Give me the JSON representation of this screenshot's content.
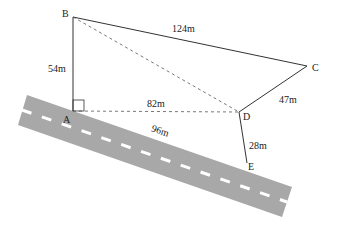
{
  "diagram": {
    "type": "geometry-figure",
    "road": {
      "fill": "#a8a8a8",
      "dash_color": "#ffffff",
      "length_label": "96m"
    },
    "points": {
      "A": {
        "label": "A",
        "x": 73,
        "y": 111
      },
      "B": {
        "label": "B",
        "x": 73,
        "y": 17
      },
      "C": {
        "label": "C",
        "x": 307,
        "y": 66
      },
      "D": {
        "label": "D",
        "x": 239,
        "y": 112
      },
      "E": {
        "label": "E",
        "x": 247,
        "y": 163
      }
    },
    "segments": [
      {
        "from": "A",
        "to": "B",
        "label": "54m",
        "style": "solid"
      },
      {
        "from": "B",
        "to": "C",
        "label": "124m",
        "style": "solid"
      },
      {
        "from": "C",
        "to": "D",
        "label": "47m",
        "style": "solid"
      },
      {
        "from": "D",
        "to": "E",
        "label": "28m",
        "style": "solid"
      },
      {
        "from": "A",
        "to": "D",
        "label": "82m",
        "style": "dashed"
      },
      {
        "from": "B",
        "to": "D",
        "label": "",
        "style": "dashed"
      }
    ],
    "right_angle_at": "A",
    "labels": {
      "AB": "54m",
      "BC": "124m",
      "CD": "47m",
      "DE": "28m",
      "AD": "82m",
      "AE_road": "96m"
    }
  }
}
